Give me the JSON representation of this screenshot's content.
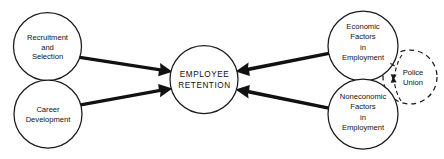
{
  "diagram": {
    "background_color": "#ffffff",
    "stroke_color": "#1a1a1a",
    "text_color": "#111111",
    "nodes": [
      {
        "id": "recruitment-selection",
        "label_lines": [
          "Recruitment",
          "and",
          "Selection"
        ],
        "shape": "circle",
        "line_style": "solid",
        "cx": 47.5,
        "cy": 46.5,
        "r": 34
      },
      {
        "id": "career-development",
        "label_lines": [
          "Career",
          "Development"
        ],
        "shape": "circle",
        "line_style": "solid",
        "cx": 48,
        "cy": 114,
        "r": 34
      },
      {
        "id": "employee-retention",
        "label_lines": [
          "EMPLOYEE",
          "RETENTION"
        ],
        "shape": "circle",
        "line_style": "solid",
        "cx": 204,
        "cy": 79.5,
        "r": 34
      },
      {
        "id": "economic-factors",
        "label_lines": [
          "Economic",
          "Factors",
          "in",
          "Employment"
        ],
        "shape": "circle",
        "line_style": "solid",
        "cx": 363,
        "cy": 46,
        "r": 35
      },
      {
        "id": "noneconomic-factors",
        "label_lines": [
          "Noneconomic",
          "Factors",
          "in",
          "Employment"
        ],
        "shape": "circle",
        "line_style": "solid",
        "cx": 363,
        "cy": 114,
        "r": 35
      },
      {
        "id": "police-union",
        "label_lines": [
          "Police",
          "Union"
        ],
        "shape": "circle",
        "line_style": "dashed",
        "cx": 410,
        "cy": 77,
        "r": 27
      }
    ],
    "connections": [
      {
        "id": "recruitment-to-retention",
        "from": "recruitment-selection",
        "to": "employee-retention",
        "style": "solid-tapered-arrow",
        "direction": "right"
      },
      {
        "id": "career-to-retention",
        "from": "career-development",
        "to": "employee-retention",
        "style": "solid-tapered-arrow",
        "direction": "right"
      },
      {
        "id": "economic-to-retention",
        "from": "economic-factors",
        "to": "employee-retention",
        "style": "solid-tapered-arrow",
        "direction": "left"
      },
      {
        "id": "noneconomic-to-retention",
        "from": "noneconomic-factors",
        "to": "employee-retention",
        "style": "solid-tapered-arrow",
        "direction": "left"
      },
      {
        "id": "union-to-economic",
        "from": "police-union",
        "to": "economic-factors",
        "style": "dashed-curved-arrow",
        "direction": "left"
      },
      {
        "id": "union-to-noneconomic",
        "from": "police-union",
        "to": "noneconomic-factors",
        "style": "dashed-curved-arrow",
        "direction": "left"
      }
    ]
  }
}
